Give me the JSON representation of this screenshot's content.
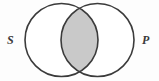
{
  "figure": {
    "type": "venn-diagram",
    "title": "",
    "width": 159,
    "height": 81,
    "background_color": "#fdfdfd",
    "stroke_color": "#3b3b3b",
    "stroke_width": 1.6,
    "circle_fill": "#ffffff",
    "intersection_fill": "#c9c9c9",
    "circles": [
      {
        "id": "circle-s",
        "label": "S",
        "cx": 61.5,
        "cy": 40,
        "r": 36.5
      },
      {
        "id": "circle-p",
        "label": "P",
        "cx": 97.5,
        "cy": 40,
        "r": 36.5
      }
    ],
    "regions": [
      {
        "id": "region-s-only",
        "name": "S only",
        "shaded": false
      },
      {
        "id": "region-intersection",
        "name": "S and P",
        "shaded": true
      },
      {
        "id": "region-p-only",
        "name": "P only",
        "shaded": false
      }
    ],
    "labels": {
      "left": "S",
      "right": "P"
    }
  }
}
